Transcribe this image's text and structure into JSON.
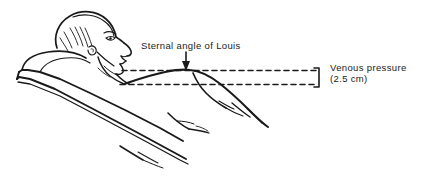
{
  "figure": {
    "background_color": "#ffffff",
    "ink_color": "#1a1a1a",
    "annotations": {
      "sternal_angle_label": "Sternal angle of Louis",
      "venous_pressure_label": "Venous pressure",
      "venous_pressure_value": "(2.5 cm)"
    },
    "markers": {
      "arrow": "down-arrow-icon",
      "bracket": "measurement-bracket-icon",
      "reference_line_style": "dashed"
    },
    "anatomy": [
      "head",
      "face-profile",
      "neck",
      "chest",
      "torso",
      "arm",
      "hand"
    ],
    "furniture": [
      "pillow",
      "inclined-bed"
    ]
  }
}
